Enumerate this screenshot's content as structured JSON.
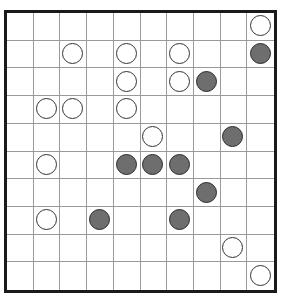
{
  "board": {
    "rows": 10,
    "cols": 10,
    "colors": {
      "white_fill": "#ffffff",
      "black_fill": "#6e6e6e",
      "grid_line": "#9a9a9a",
      "border": "#1a1a1a"
    },
    "stones": [
      {
        "row": 0,
        "col": 9,
        "color": "white"
      },
      {
        "row": 1,
        "col": 2,
        "color": "white"
      },
      {
        "row": 1,
        "col": 4,
        "color": "white"
      },
      {
        "row": 1,
        "col": 6,
        "color": "white"
      },
      {
        "row": 1,
        "col": 9,
        "color": "black"
      },
      {
        "row": 2,
        "col": 4,
        "color": "white"
      },
      {
        "row": 2,
        "col": 6,
        "color": "white"
      },
      {
        "row": 2,
        "col": 7,
        "color": "black"
      },
      {
        "row": 3,
        "col": 1,
        "color": "white"
      },
      {
        "row": 3,
        "col": 2,
        "color": "white"
      },
      {
        "row": 3,
        "col": 4,
        "color": "white"
      },
      {
        "row": 4,
        "col": 5,
        "color": "white"
      },
      {
        "row": 4,
        "col": 8,
        "color": "black"
      },
      {
        "row": 5,
        "col": 1,
        "color": "white"
      },
      {
        "row": 5,
        "col": 4,
        "color": "black"
      },
      {
        "row": 5,
        "col": 5,
        "color": "black"
      },
      {
        "row": 5,
        "col": 6,
        "color": "black"
      },
      {
        "row": 6,
        "col": 7,
        "color": "black"
      },
      {
        "row": 7,
        "col": 1,
        "color": "white"
      },
      {
        "row": 7,
        "col": 3,
        "color": "black"
      },
      {
        "row": 7,
        "col": 6,
        "color": "black"
      },
      {
        "row": 8,
        "col": 8,
        "color": "white"
      },
      {
        "row": 9,
        "col": 9,
        "color": "white"
      }
    ]
  }
}
